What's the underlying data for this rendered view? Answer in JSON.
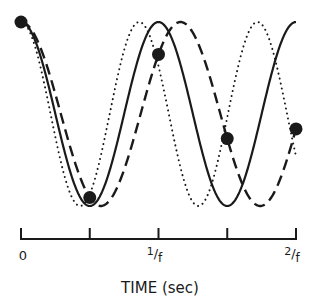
{
  "chart_data": {
    "type": "line",
    "title": "",
    "xlabel": "TIME (sec)",
    "ylabel": "",
    "x_ticks": [
      {
        "t": 0,
        "label": "0"
      },
      {
        "t": 0.5,
        "label": ""
      },
      {
        "t": 1,
        "label": "1/f"
      },
      {
        "t": 1.5,
        "label": ""
      },
      {
        "t": 2,
        "label": "2/f"
      }
    ],
    "xlim": [
      0,
      2
    ],
    "ylim": [
      -1,
      1
    ],
    "x_units": "periods of 1/f",
    "series": [
      {
        "name": "signal",
        "style": "solid",
        "period": 1.0
      },
      {
        "name": "higher-frequency",
        "style": "dotted",
        "period": 0.86
      },
      {
        "name": "lower-frequency",
        "style": "dashed",
        "period": 1.16
      }
    ],
    "samples": {
      "on_series": "lower-frequency",
      "t": [
        0,
        0.5,
        1,
        1.5,
        2
      ]
    },
    "grid": false,
    "legend": "none",
    "color": "#1a1a1a"
  }
}
